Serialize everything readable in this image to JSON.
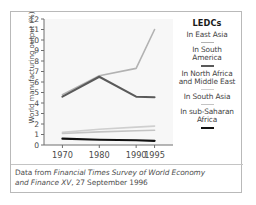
{
  "figure": {
    "ylabel": "World manufacturing output (%)",
    "caption_line_1_prefix": "Data from ",
    "caption_line_1_italic": "Financial Times Survey of World Economy",
    "caption_line_2_italic": "and Finance XV",
    "caption_line_2_suffix": ", 27 September 1996"
  },
  "legend": {
    "title": "LEDCs",
    "items": [
      {
        "label_line_1": "In East Asia",
        "label_line_2": "",
        "color": "#b2b2b2",
        "width": 1.6
      },
      {
        "label_line_1": "In South",
        "label_line_2": "America",
        "color": "#5a5a5a",
        "width": 2.0
      },
      {
        "label_line_1": "In North Africa",
        "label_line_2": "and Middle East",
        "color": "#cfcfcf",
        "width": 1.6
      },
      {
        "label_line_1": "In South Asia",
        "label_line_2": "",
        "color": "#c4c4c4",
        "width": 1.6
      },
      {
        "label_line_1": "In sub-Saharan",
        "label_line_2": "Africa",
        "color": "#111111",
        "width": 2.2
      }
    ]
  },
  "chart_data": {
    "type": "line",
    "title": "",
    "xlabel": "",
    "ylabel": "World manufacturing output (%)",
    "x": [
      1970,
      1980,
      1990,
      1995
    ],
    "xtick_labels": [
      "1970",
      "1980",
      "1990",
      "1995"
    ],
    "ytick_labels": [
      "0",
      "1",
      "2",
      "3",
      "4",
      "5",
      "6",
      "7",
      "8",
      "9",
      "10",
      "11",
      "12"
    ],
    "xlim": [
      1965,
      2000
    ],
    "ylim": [
      0,
      12
    ],
    "grid": false,
    "legend_position": "right",
    "series": [
      {
        "name": "In East Asia",
        "values": [
          4.8,
          6.6,
          7.3,
          11.0
        ],
        "color": "#b2b2b2"
      },
      {
        "name": "In South America",
        "values": [
          4.6,
          6.5,
          4.6,
          4.55
        ],
        "color": "#5a5a5a"
      },
      {
        "name": "In North Africa and Middle East",
        "values": [
          1.2,
          1.5,
          1.7,
          1.8
        ],
        "color": "#cfcfcf"
      },
      {
        "name": "In South Asia",
        "values": [
          1.1,
          1.25,
          1.35,
          1.4
        ],
        "color": "#c4c4c4"
      },
      {
        "name": "In sub-Saharan Africa",
        "values": [
          0.6,
          0.5,
          0.45,
          0.4
        ],
        "color": "#111111"
      }
    ]
  }
}
